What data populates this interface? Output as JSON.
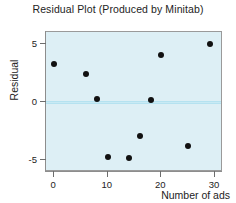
{
  "chart_data": {
    "type": "scatter",
    "title": "Residual Plot (Produced by Minitab)",
    "xlabel": "Number of ads",
    "ylabel": "Residual",
    "xlim": [
      -1.5,
      31.5
    ],
    "ylim": [
      -6.0,
      6.0
    ],
    "xticks": [
      0,
      10,
      20,
      30
    ],
    "xticklabels": [
      "0",
      "10",
      "20",
      "30"
    ],
    "yticks": [
      5,
      0,
      -5
    ],
    "yticklabels": [
      "5",
      "0",
      "-5"
    ],
    "grid": false,
    "legend": null,
    "reference_line": {
      "y": 0,
      "color": "#c9eaf4",
      "label": "zero-line"
    },
    "plot_background": "#ddeff5",
    "point_color": "#111111",
    "points": [
      {
        "x": 0,
        "y": 3.3
      },
      {
        "x": 6,
        "y": 2.4
      },
      {
        "x": 8,
        "y": 0.3
      },
      {
        "x": 10,
        "y": -4.7
      },
      {
        "x": 14,
        "y": -4.8
      },
      {
        "x": 16,
        "y": -2.9
      },
      {
        "x": 18,
        "y": 0.2
      },
      {
        "x": 20,
        "y": 4.0
      },
      {
        "x": 25,
        "y": -3.8
      },
      {
        "x": 29,
        "y": 5.0
      }
    ]
  }
}
